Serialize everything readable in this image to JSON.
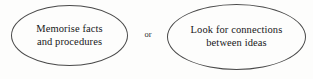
{
  "diagram": {
    "title": "Memorise facts and procedures or Look for connections between ideas",
    "background_color": "#fdfdfc",
    "stroke_color": "#4a4a4a",
    "text_color": "#17171a",
    "nodes": [
      {
        "id": "memorise",
        "shape": "ellipse",
        "lines": [
          "Memorise facts",
          "and procedures"
        ]
      },
      {
        "id": "connections",
        "shape": "ellipse",
        "lines": [
          "Look for connections",
          "between ideas"
        ]
      }
    ],
    "connector": {
      "label": "or"
    }
  }
}
